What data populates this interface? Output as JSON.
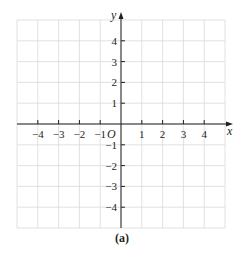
{
  "figure": {
    "caption": "(a)",
    "axes": {
      "x_label": "x",
      "y_label": "y",
      "origin_label": "O",
      "x_ticks": [
        "−4",
        "−3",
        "−2",
        "−1",
        "1",
        "2",
        "3",
        "4"
      ],
      "x_tick_values": [
        -4,
        -3,
        -2,
        -1,
        1,
        2,
        3,
        4
      ],
      "y_ticks": [
        "4",
        "3",
        "2",
        "1",
        "−1",
        "−2",
        "−3",
        "−4"
      ],
      "y_tick_values": [
        4,
        3,
        2,
        1,
        -1,
        -2,
        -3,
        -4
      ],
      "x_range": [
        -5,
        5
      ],
      "y_range": [
        -5,
        5
      ]
    },
    "grid": {
      "visible": true,
      "spacing": 1
    },
    "colors": {
      "axis": "#231f20",
      "grid": "#d9d9d9",
      "text": "#231f20",
      "background": "#ffffff"
    }
  }
}
